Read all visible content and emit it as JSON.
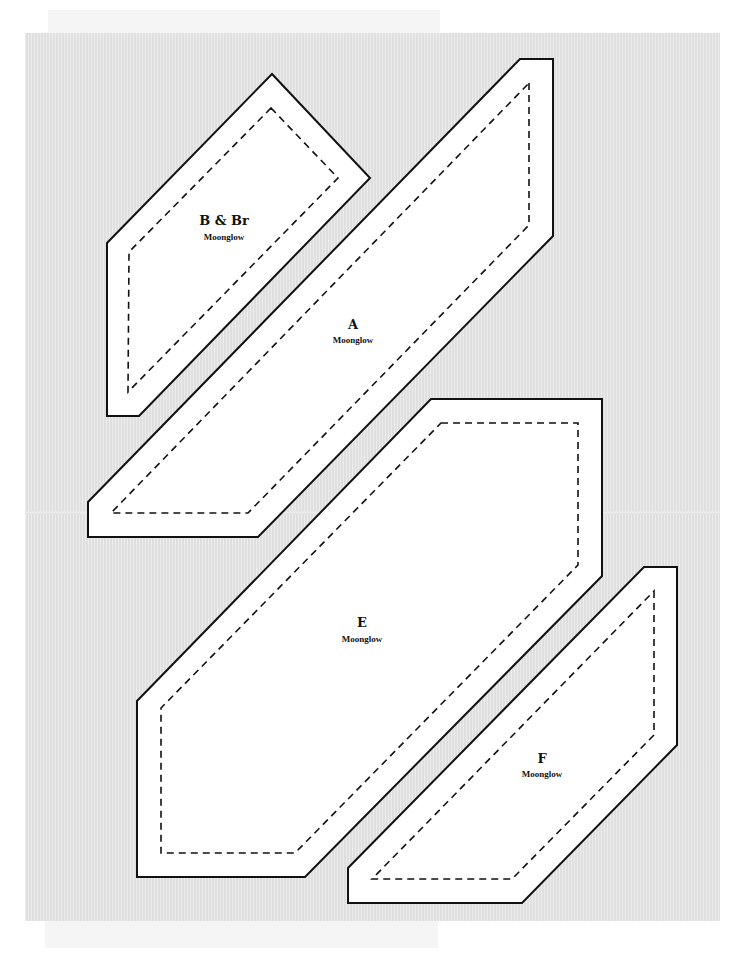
{
  "page": {
    "width": 749,
    "height": 955,
    "background": "#ffffff",
    "sheet": {
      "x": 25,
      "y": 33,
      "w": 695,
      "h": 888,
      "color": "#e3e3e3"
    },
    "top_strip": {
      "x": 48,
      "y": 10,
      "w": 392,
      "h": 23
    },
    "bottom_strip": {
      "x": 45,
      "y": 921,
      "w": 393,
      "h": 27
    },
    "fold_line": {
      "x": 25,
      "y": 511,
      "w": 695
    }
  },
  "colors": {
    "outline": "#111111",
    "piece_fill": "#ffffff",
    "sheet": "#e3e3e3"
  },
  "pieces": [
    {
      "id": "B & Br",
      "label": "B & Br",
      "fabric": "Moonglow",
      "label_pos": {
        "x": 224,
        "y": 214
      },
      "fabric_pos": {
        "x": 224,
        "y": 233
      },
      "outer": "272,74 370,178 139,416 107,416 107,243",
      "inner": "271,108 338,178 128,392 129,252"
    },
    {
      "id": "A",
      "label": "A",
      "fabric": "Moonglow",
      "label_pos": {
        "x": 353,
        "y": 318
      },
      "fabric_pos": {
        "x": 353,
        "y": 336
      },
      "outer": "520,59 553,59 553,236 258,537 88,537 88,502",
      "inner": "529,83 529,225 248,513 111,513"
    },
    {
      "id": "E",
      "label": "E",
      "fabric": "Moonglow",
      "label_pos": {
        "x": 362,
        "y": 616
      },
      "fabric_pos": {
        "x": 362,
        "y": 635
      },
      "outer": "431,399 602,399 602,576 305,877 137,877 137,701",
      "inner": "441,423 578,423 578,565 295,853 161,853 161,708"
    },
    {
      "id": "F",
      "label": "F",
      "fabric": "Moonglow",
      "label_pos": {
        "x": 542,
        "y": 752
      },
      "fabric_pos": {
        "x": 542,
        "y": 770
      },
      "outer": "644,567 677,567 677,745 522,903 348,903 348,868",
      "inner": "654,591 654,735 512,879 372,879"
    }
  ]
}
